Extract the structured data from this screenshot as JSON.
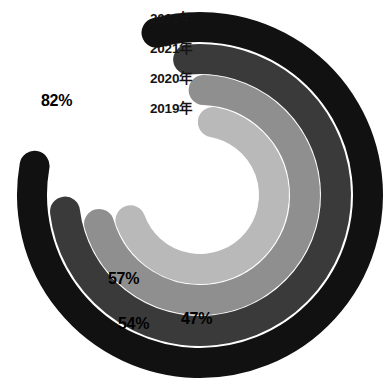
{
  "chart_data": {
    "type": "pie",
    "subtype": "concentric-radial-bar",
    "title": "",
    "subtitle": "",
    "xlabel": "",
    "ylabel": "",
    "legend_position": "top-left-inline",
    "grid": false,
    "value_unit": "%",
    "value_max": 100,
    "start_angle_deg": -90,
    "direction": "clockwise",
    "categories": [
      "2022年",
      "2021年",
      "2020年",
      "2019年"
    ],
    "values": [
      82,
      54,
      47,
      57
    ],
    "value_labels": [
      "82%",
      "54%",
      "47%",
      "57%"
    ],
    "colors": [
      "#111111",
      "#3a3a3a",
      "#8f8f8f",
      "#b9b9b9"
    ],
    "series": [
      {
        "name": "2022年",
        "label": "2022年",
        "value": 82,
        "value_label": "82%",
        "color": "#111111",
        "ring": "outer",
        "ring_index": 0,
        "radius": 168,
        "thickness": 30,
        "sweep_deg": 295,
        "start_deg": -105
      },
      {
        "name": "2021年",
        "label": "2021年",
        "value": 54,
        "value_label": "54%",
        "color": "#3a3a3a",
        "ring": "second",
        "ring_index": 1,
        "radius": 136,
        "thickness": 30,
        "sweep_deg": 268,
        "start_deg": -95
      },
      {
        "name": "2020年",
        "label": "2020年",
        "value": 47,
        "value_label": "47%",
        "color": "#8f8f8f",
        "ring": "third",
        "ring_index": 2,
        "radius": 105,
        "thickness": 30,
        "sweep_deg": 252,
        "start_deg": -88
      },
      {
        "name": "2019年",
        "label": "2019年",
        "value": 57,
        "value_label": "57%",
        "color": "#b9b9b9",
        "ring": "inner",
        "ring_index": 3,
        "radius": 74,
        "thickness": 30,
        "sweep_deg": 240,
        "start_deg": -80
      }
    ]
  },
  "legend": {
    "items": [
      {
        "label": "2022年",
        "color": "#111111"
      },
      {
        "label": "2021年",
        "color": "#3a3a3a"
      },
      {
        "label": "2020年",
        "color": "#8f8f8f"
      },
      {
        "label": "2019年",
        "color": "#b9b9b9"
      }
    ]
  },
  "values": {
    "v2022": "82%",
    "v2021": "54%",
    "v2020": "47%",
    "v2019": "57%"
  },
  "colors": {
    "background": "#ffffff",
    "ring_2022": "#111111",
    "ring_2021": "#3a3a3a",
    "ring_2020": "#8f8f8f",
    "ring_2019": "#b9b9b9",
    "label_dark": "#141414"
  }
}
